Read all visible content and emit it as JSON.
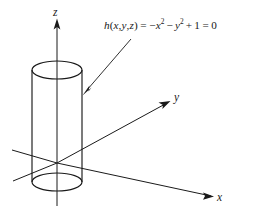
{
  "figure": {
    "background_color": "#ffffff",
    "line_color": "#1a1a1a",
    "equation": {
      "function_name": "h",
      "arguments": "(x, y, z)",
      "full_text": "h(x,y,z) = -x^2 - y^2 + 1 = 0",
      "parts": {
        "h": "h",
        "open_paren": "(",
        "var_x": "x",
        "comma1": ",",
        "var_y": "y",
        "comma2": ",",
        "var_z": "z",
        "close_paren": ")",
        "equals1": "=",
        "minus1": "−",
        "term_x_base": "x",
        "term_x_exp": "2",
        "minus2": "−",
        "term_y_base": "y",
        "term_y_exp": "2",
        "plus": "+",
        "constant": "1",
        "equals2": "=",
        "zero": "0"
      }
    },
    "axes": [
      {
        "name": "z-axis",
        "label": "z",
        "direction": "up"
      },
      {
        "name": "y-axis",
        "label": "y",
        "direction": "upper-right"
      },
      {
        "name": "x-axis",
        "label": "x",
        "direction": "lower-right"
      }
    ],
    "shape": {
      "name": "cylinder",
      "description": "vertical circular cylinder of radius 1 centered on the z-axis",
      "radius_units": 1
    },
    "annotation": {
      "name": "equation-leader-arrow",
      "points_to": "cylinder surface"
    }
  }
}
